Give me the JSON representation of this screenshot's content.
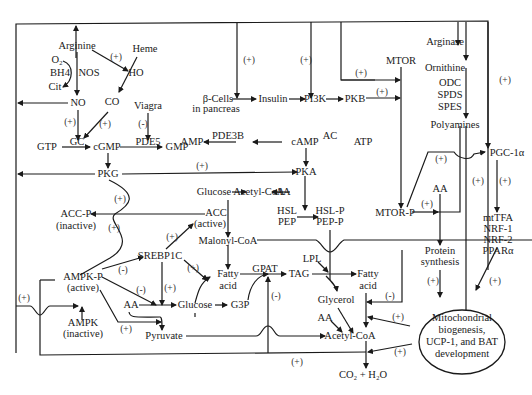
{
  "diagram": {
    "type": "metabolic-signaling-pathway",
    "nodes": {
      "arginine": "Arginine",
      "heme": "Heme",
      "o2": "O₂",
      "bh4": "BH4",
      "nos": "NOS",
      "cit": "Cit",
      "ho": "HO",
      "no": "NO",
      "co": "CO",
      "viagra": "Viagra",
      "pde5": "PDE5",
      "gtp": "GTP",
      "gc": "GC",
      "cgmp": "cGMP",
      "gmp": "GMP",
      "pkg": "PKG",
      "beta_cells": "β-Cells",
      "in_pancreas": "in pancreas",
      "insulin": "Insulin",
      "pi3k": "PI3K",
      "pkb": "PKB",
      "mtor": "MTOR",
      "arginase": "Arginase",
      "ornithine": "Ornithine",
      "odc": "ODC",
      "spds": "SPDS",
      "spes": "SPES",
      "polyamines": "Polyamines",
      "amp": "AMP",
      "pde3b": "PDE3B",
      "camp": "cAMP",
      "ac": "AC",
      "atp": "ATP",
      "pka": "PKA",
      "pgc1a": "PGC-1α",
      "glucose_top": "Glucose",
      "acetyl_coa_top": "Acetyl-CoA",
      "aa_top": "AA",
      "acc_p": "ACC-P",
      "acc_p_state": "(inactive)",
      "acc": "ACC",
      "acc_state": "(active)",
      "hsl": "HSL",
      "pep": "PEP",
      "hsl_p": "HSL-P",
      "pep_p": "PEP-P",
      "mtor_p": "MTOR-P",
      "aa_mtor": "AA",
      "protein": "Protein",
      "synthesis": "synthesis",
      "mttfa": "mtTFA",
      "nrf1": "NRF-1",
      "nrf2": "NRF-2",
      "ppara": "PPARα",
      "malonyl_coa": "Malonyl-CoA",
      "srebp1c": "SREBP1C",
      "ampk_p": "AMPK-P",
      "ampk_p_state": "(active)",
      "ampk": "AMPK",
      "ampk_state": "(inactive)",
      "fatty": "Fatty",
      "acid": "acid",
      "gpat": "GPAT",
      "tag": "TAG",
      "lpl": "LPL",
      "fatty2": "Fatty",
      "acid2": "acid",
      "aa_glucose": "AA",
      "glucose": "Glucose",
      "g3p": "G3P",
      "glycerol": "Glycerol",
      "aa_bottom": "AA",
      "pyruvate": "Pyruvate",
      "acetyl_coa": "Acetyl-CoA",
      "co2_h2o": "CO₂ + H₂O",
      "mito_line1": "Mitochondrial",
      "mito_line2": "biogenesis,",
      "mito_line3": "UCP-1, and BAT",
      "mito_line4": "development"
    },
    "signs": {
      "plus": "(+)",
      "minus": "(-)"
    }
  }
}
